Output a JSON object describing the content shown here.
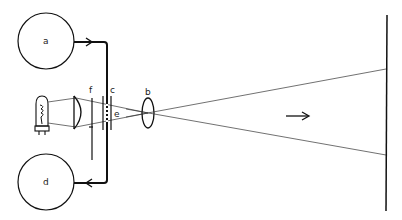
{
  "diagram": {
    "labels": {
      "reel_top": "a",
      "lens": "b",
      "film_gate": "c",
      "reel_bottom": "d",
      "aperture": "e",
      "shutter": "f"
    },
    "colors": {
      "line": "#111111",
      "background": "#ffffff"
    }
  }
}
